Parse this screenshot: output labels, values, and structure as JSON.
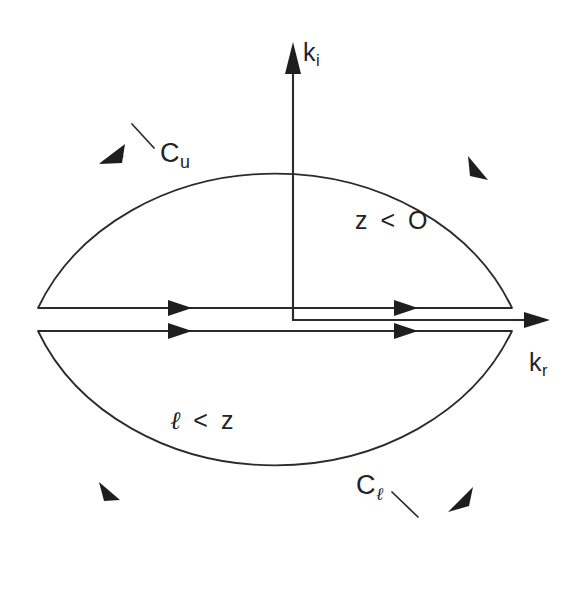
{
  "figure": {
    "domain": "diagram",
    "kind": "complex-k-plane-contour",
    "background_color": "#ffffff",
    "ink_color": "#2b2b2b",
    "width": 588,
    "height": 598
  },
  "axes": {
    "imaginary": {
      "label_base": "k",
      "label_sub": "i",
      "name": "k-imaginary-axis",
      "direction": "up"
    },
    "real": {
      "label_base": "k",
      "label_sub": "r",
      "name": "k-real-axis",
      "direction": "right"
    }
  },
  "contours": [
    {
      "id": "upper",
      "label_base": "C",
      "label_sub": "u",
      "description": "upper semicircular contour",
      "orientation": "counterclockwise"
    },
    {
      "id": "lower",
      "label_base": "C",
      "label_sub": "ℓ",
      "description": "lower semicircular contour",
      "orientation": "clockwise"
    }
  ],
  "region_labels": [
    {
      "id": "upper-region",
      "text": "z < O"
    },
    {
      "id": "lower-region",
      "text_ell": "ℓ",
      "text_rest": " < z"
    }
  ],
  "geometry": {
    "center_x": 293,
    "upper_line_y": 308,
    "lower_line_y": 331,
    "radius_x": 237,
    "upper_apex_y": 95,
    "lower_apex_y": 562,
    "axis_top_y": 40,
    "axis_corner_y": 320,
    "kr_arrow_tip_x": 548,
    "arc_left_x": 38,
    "arc_right_x": 512
  }
}
